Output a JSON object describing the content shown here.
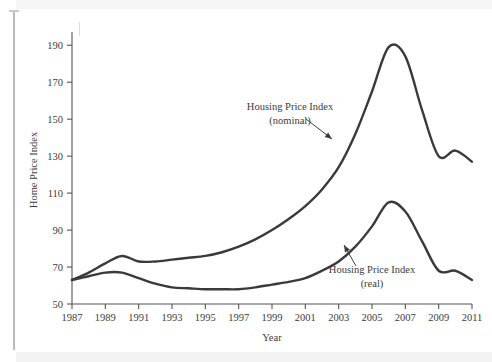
{
  "figure": {
    "background_color": "#ffffff",
    "line_color": "#3a3a3a",
    "axis_color": "#555555",
    "text_color": "#3c3c3c"
  },
  "chart_data": {
    "type": "line",
    "title": "",
    "xlabel": "Year",
    "ylabel": "Home Price Index",
    "xlim": [
      1987,
      2011
    ],
    "ylim": [
      50,
      195
    ],
    "xticks": [
      1987,
      1989,
      1991,
      1993,
      1995,
      1997,
      1999,
      2001,
      2003,
      2005,
      2007,
      2009,
      2011
    ],
    "xtick_labels": [
      "1987",
      "1989",
      "1991",
      "1993",
      "1995",
      "1997",
      "1999",
      "2001",
      "2003",
      "2005",
      "2007",
      "2009",
      "2011"
    ],
    "yticks": [
      50,
      70,
      90,
      110,
      130,
      150,
      170,
      190
    ],
    "ytick_labels": [
      "50",
      "70",
      "90",
      "110",
      "130",
      "150",
      "170",
      "190"
    ],
    "grid": false,
    "legend": "annotations",
    "x": [
      1987,
      1988,
      1989,
      1990,
      1991,
      1992,
      1993,
      1994,
      1995,
      1996,
      1997,
      1998,
      1999,
      2000,
      2001,
      2002,
      2003,
      2004,
      2005,
      2006,
      2007,
      2008,
      2009,
      2010,
      2011
    ],
    "series": [
      {
        "name": "Housing Price Index (nominal)",
        "values": [
          63,
          67,
          72,
          76,
          73,
          73,
          74,
          75,
          76,
          78,
          81,
          85,
          90,
          96,
          103,
          112,
          124,
          142,
          165,
          189,
          184,
          155,
          130,
          133,
          127
        ]
      },
      {
        "name": "Housing Price Index (real)",
        "values": [
          63,
          65,
          67,
          67,
          64,
          61,
          59,
          58.5,
          58,
          58,
          58,
          59,
          60.5,
          62,
          64,
          68,
          73,
          81,
          92,
          105,
          100,
          84,
          68,
          68,
          63
        ]
      }
    ],
    "annotations": [
      {
        "id": "nominal",
        "label_line1": "Housing Price Index",
        "label_line2": "(nominal)",
        "points_to_year": 2003,
        "points_to_value": 127
      },
      {
        "id": "real",
        "label_line1": "Housing Price Index",
        "label_line2": "(real)",
        "points_to_year": 2004,
        "points_to_value": 82
      }
    ]
  }
}
